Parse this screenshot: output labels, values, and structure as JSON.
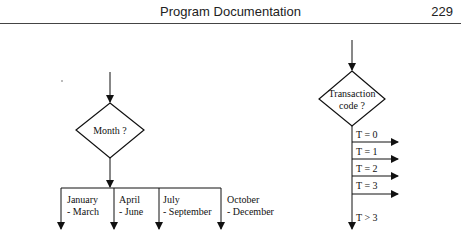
{
  "header": {
    "title": "Program Documentation",
    "page_number": "229"
  },
  "diagram_left": {
    "decision": "Month ?",
    "branches": [
      {
        "line1": "January",
        "line2": "- March"
      },
      {
        "line1": "April",
        "line2": "- June"
      },
      {
        "line1": "July",
        "line2": "- September"
      },
      {
        "line1": "October",
        "line2": "- December"
      }
    ]
  },
  "diagram_right": {
    "decision_line1": "Transaction",
    "decision_line2": "code ?",
    "branches": [
      "T = 0",
      "T = 1",
      "T = 2",
      "T = 3"
    ],
    "default_branch": "T > 3"
  }
}
